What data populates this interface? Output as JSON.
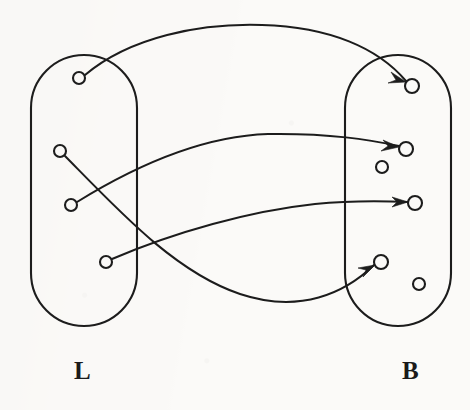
{
  "figure": {
    "type": "mapping-diagram",
    "background_color": "#fbfaf8",
    "ink_color": "#1c1c1c",
    "width": 470,
    "height": 410
  },
  "labels": {
    "left_set": "L",
    "right_set": "B"
  },
  "sets": [
    {
      "name": "left-set",
      "label": "L",
      "shape": "stadium",
      "x": 31,
      "y": 55,
      "width": 106,
      "height": 271,
      "radius": 53
    },
    {
      "name": "right-set",
      "label": "B",
      "shape": "stadium",
      "x": 345,
      "y": 55,
      "width": 106,
      "height": 271,
      "radius": 53
    }
  ],
  "nodes": {
    "left": [
      {
        "id": "l1",
        "cx": 79,
        "cy": 78,
        "r": 6
      },
      {
        "id": "l2",
        "cx": 60,
        "cy": 151,
        "r": 6
      },
      {
        "id": "l3",
        "cx": 71,
        "cy": 205,
        "r": 6
      },
      {
        "id": "l4",
        "cx": 106,
        "cy": 262,
        "r": 6
      }
    ],
    "right": [
      {
        "id": "b1",
        "cx": 412,
        "cy": 86,
        "r": 7
      },
      {
        "id": "b2",
        "cx": 406,
        "cy": 149,
        "r": 7
      },
      {
        "id": "b3",
        "cx": 382,
        "cy": 167,
        "r": 6
      },
      {
        "id": "b4",
        "cx": 415,
        "cy": 203,
        "r": 7
      },
      {
        "id": "b5",
        "cx": 381,
        "cy": 262,
        "r": 7
      },
      {
        "id": "b6",
        "cx": 419,
        "cy": 284,
        "r": 6
      }
    ]
  },
  "edges": [
    {
      "id": "edge-l1-b1",
      "from": "l1",
      "to": "b1",
      "path": "M 85 75 C 130 37 200 23 262 25 C 330 27 378 48 406 81",
      "arrow_tip": {
        "x": 406,
        "y": 81
      },
      "arrow_angle": 49
    },
    {
      "id": "edge-l3-b2",
      "from": "l3",
      "to": "b2",
      "path": "M 77 202 C 140 163 205 136 268 134 C 330 133 370 140 399 146",
      "arrow_tip": {
        "x": 399,
        "y": 146
      },
      "arrow_angle": 12
    },
    {
      "id": "edge-l4-b4",
      "from": "l4",
      "to": "b4",
      "path": "M 112 259 C 175 232 250 211 315 204 C 355 200 385 201 408 202",
      "arrow_tip": {
        "x": 408,
        "y": 202
      },
      "arrow_angle": 2
    },
    {
      "id": "edge-l2-b5",
      "from": "l2",
      "to": "b5",
      "path": "M 65 156 C 120 212 175 272 240 294 C 300 314 345 293 374 265",
      "arrow_tip": {
        "x": 374,
        "y": 265
      },
      "arrow_angle": -43
    }
  ],
  "unmapped_nodes": [
    "b3",
    "b6"
  ],
  "counts": {
    "left_nodes": 4,
    "right_nodes": 6,
    "arrows": 4
  }
}
